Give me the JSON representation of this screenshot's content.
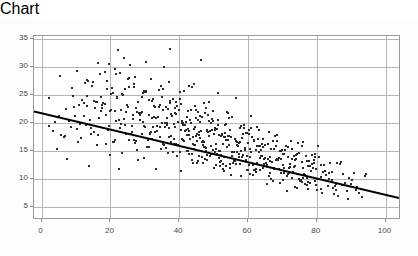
{
  "chart_data": {
    "type": "scatter",
    "title": "",
    "xlabel": "",
    "ylabel": "",
    "xlim": [
      -2.2,
      104.5
    ],
    "ylim": [
      2.6,
      35.6
    ],
    "grid": true,
    "legend": null,
    "xticks": [
      0,
      20,
      40,
      60,
      80,
      100
    ],
    "xtick_labels": [
      "0",
      "20",
      "40",
      "60",
      "80",
      "100"
    ],
    "yticks": [
      5,
      10,
      15,
      20,
      25,
      30,
      35
    ],
    "ytick_labels": [
      "5",
      "10",
      "15",
      "20",
      "25",
      "30",
      "35"
    ],
    "marker": {
      "shape": "square",
      "size_px": 2,
      "color": "#2b2b2b"
    },
    "trendline": {
      "type": "linear",
      "color": "#000000",
      "width_px": 2,
      "x_start": -2.2,
      "y_start": 21.9,
      "x_end": 104.5,
      "y_end": 6.2,
      "slope": -0.147,
      "intercept": 21.58
    },
    "n_points": 720,
    "series": [
      {
        "name": "observations",
        "x": [
          16.4,
          21.9,
          12.3,
          46.0,
          36.9,
          21.1,
          25.4,
          14.8,
          18.7,
          23.2,
          30.1,
          19.5,
          27.0,
          33.8,
          41.2,
          17.6,
          22.5,
          28.9,
          35.4,
          44.1,
          12.9,
          15.3,
          20.2,
          24.8,
          31.6,
          38.0,
          42.7,
          47.3,
          51.0,
          55.2,
          8.2,
          10.5,
          13.7,
          16.9,
          19.1,
          23.9,
          26.3,
          29.8,
          32.4,
          34.7,
          37.1,
          39.6,
          43.3,
          45.8,
          48.5,
          50.9,
          53.6,
          56.1,
          58.4,
          60.7,
          5.4,
          7.8,
          11.2,
          14.1,
          17.3,
          20.8,
          22.7,
          25.9,
          28.1,
          30.6,
          33.2,
          35.9,
          38.7,
          40.4,
          42.1,
          44.6,
          46.9,
          49.2,
          52.0,
          54.3,
          57.0,
          59.5,
          62.2,
          64.8,
          67.1,
          69.4,
          71.8,
          74.3,
          76.9,
          79.2,
          2.9,
          6.1,
          9.4,
          12.6,
          15.8,
          18.2,
          21.4,
          24.1,
          27.3,
          29.0,
          31.8,
          34.1,
          36.5,
          38.9,
          41.0,
          43.5,
          45.2,
          47.8,
          50.1,
          52.6,
          55.0,
          57.4,
          59.9,
          62.5,
          65.0,
          67.6,
          70.1,
          72.5,
          75.0,
          77.4,
          4.2,
          7.1,
          10.3,
          13.4,
          16.2,
          19.7,
          22.3,
          25.1,
          27.8,
          30.4,
          32.9,
          35.3,
          37.8,
          40.2,
          42.8,
          45.0,
          47.5,
          49.8,
          52.3,
          54.7,
          57.2,
          59.6,
          62.0,
          64.4,
          66.9,
          69.2,
          71.4,
          73.8,
          76.2,
          78.6,
          3.5,
          6.7,
          9.9,
          12.1,
          15.0,
          18.5,
          21.0,
          23.6,
          26.8,
          29.4,
          31.1,
          33.6,
          36.0,
          38.4,
          40.9,
          43.1,
          45.6,
          48.0,
          50.5,
          53.0,
          55.5,
          58.0,
          60.4,
          62.8,
          65.3,
          67.8,
          70.3,
          72.8,
          75.3,
          77.8,
          11.5,
          14.4,
          17.0,
          19.9,
          22.1,
          24.5,
          26.0,
          28.6,
          31.3,
          33.0,
          35.7,
          37.4,
          39.2,
          41.6,
          43.9,
          46.2,
          48.7,
          51.2,
          53.4,
          55.8,
          58.2,
          60.6,
          63.1,
          65.6,
          68.0,
          70.6,
          73.0,
          75.6,
          78.0,
          80.4,
          20.5,
          23.0,
          25.6,
          27.1,
          29.6,
          32.1,
          34.5,
          36.8,
          39.0,
          41.4,
          43.7,
          46.5,
          49.0,
          51.5,
          54.0,
          56.5,
          59.0,
          61.4,
          63.8,
          66.2,
          68.8,
          71.2,
          73.5,
          76.0,
          78.4,
          80.9,
          83.2,
          85.6,
          88.0,
          90.4,
          24.0,
          26.5,
          28.3,
          30.9,
          33.4,
          35.1,
          37.6,
          40.0,
          42.4,
          44.8,
          47.1,
          49.5,
          52.1,
          54.5,
          57.1,
          59.4,
          61.8,
          64.2,
          66.6,
          69.0,
          71.6,
          74.0,
          76.4,
          79.0,
          81.5,
          84.0,
          86.5,
          89.0,
          91.5,
          94.0,
          30.2,
          32.6,
          34.9,
          37.2,
          39.8,
          42.2,
          44.4,
          46.8,
          48.9,
          51.4,
          53.8,
          56.2,
          58.6,
          61.0,
          63.4,
          65.8,
          68.4,
          70.8,
          73.2,
          75.8,
          13.0,
          15.6,
          18.0,
          20.4,
          22.8,
          25.2,
          27.6,
          30.0,
          32.3,
          34.6,
          36.6,
          38.6,
          40.6,
          42.6,
          44.2,
          46.4,
          48.2,
          50.2,
          52.8,
          54.9,
          57.6,
          60.0,
          62.4,
          64.6,
          67.4,
          69.8,
          72.0,
          74.6,
          77.0,
          79.6,
          8.8,
          11.9,
          14.6,
          17.4,
          19.3,
          21.7,
          24.3,
          26.7,
          29.2,
          31.5,
          33.9,
          36.2,
          38.2,
          40.8,
          42.3,
          44.9,
          47.0,
          49.4,
          51.8,
          53.2,
          56.0,
          58.8,
          61.2,
          63.6,
          66.0,
          68.6,
          71.0,
          73.4,
          75.4,
          77.2,
          1.8,
          5.0,
          8.5,
          12.8,
          16.6,
          20.0,
          23.4,
          26.2,
          28.8,
          31.0,
          33.5,
          35.5,
          37.0,
          39.4,
          41.8,
          43.4,
          45.4,
          47.2,
          49.6,
          51.6,
          54.2,
          56.8,
          58.5,
          60.2,
          62.6,
          64.0,
          66.4,
          68.2,
          70.4,
          72.2,
          74.8,
          76.6,
          79.4,
          81.0,
          83.6,
          85.0,
          87.4,
          89.6,
          92.0,
          93.6,
          19.2,
          21.2,
          23.8,
          26.6,
          29.1,
          31.7,
          34.3,
          36.4,
          38.1,
          40.1,
          42.0,
          44.0,
          45.9,
          47.6,
          49.1,
          51.1,
          53.1,
          55.1,
          57.8,
          59.2,
          61.6,
          63.0,
          65.4,
          67.0,
          69.6,
          71.6,
          73.6,
          75.2,
          77.6,
          79.8,
          27.4,
          29.9,
          32.0,
          34.0,
          36.1,
          38.3,
          40.3,
          42.5,
          44.7,
          46.6,
          48.4,
          50.4,
          52.4,
          54.4,
          56.4,
          58.1,
          60.1,
          62.1,
          64.1,
          66.1,
          68.1,
          70.0,
          72.4,
          74.4,
          76.8,
          78.8,
          80.2,
          82.0,
          84.4,
          86.0,
          10.0,
          13.2,
          16.0,
          18.8,
          21.6,
          24.7,
          27.2,
          29.5,
          31.9,
          34.2,
          36.3,
          38.5,
          40.5,
          42.9,
          44.3,
          46.1,
          47.9,
          50.0,
          51.9,
          53.9,
          55.6,
          57.5,
          59.8,
          61.9,
          63.9,
          65.9,
          67.9,
          69.9,
          71.9,
          73.9,
          45.5,
          47.4,
          49.3,
          51.3,
          52.9,
          54.6,
          56.6,
          58.3,
          60.3,
          62.3,
          43.0,
          44.5,
          46.3,
          48.3,
          50.3,
          52.2,
          53.5,
          55.4,
          57.3,
          59.3,
          39.9,
          41.3,
          43.8,
          45.7,
          47.7,
          49.7,
          51.7,
          53.3,
          55.9,
          57.7,
          36.7,
          38.8,
          40.7,
          42.7,
          44.1,
          45.1,
          46.7,
          48.6,
          50.6,
          52.5,
          59.1,
          60.5,
          61.5,
          63.2,
          64.5,
          66.3,
          67.2,
          69.1,
          70.2,
          71.1,
          72.6,
          74.1,
          75.5,
          77.1,
          78.2,
          79.1,
          80.8,
          82.4,
          84.8,
          87.0,
          2.0,
          4.8,
          6.4,
          9.2,
          11.0,
          14.2,
          15.9,
          18.4,
          20.9,
          22.4,
          80.0,
          81.8,
          83.0,
          84.2,
          85.4,
          86.8,
          88.4,
          90.0,
          91.2,
          93.0,
          25.0,
          28.4,
          30.8,
          32.8,
          35.0,
          37.3,
          39.5,
          41.9,
          43.6,
          45.3,
          47.9,
          50.8,
          52.7,
          54.1,
          56.3,
          58.9,
          61.1,
          63.3,
          65.2,
          67.3,
          69.3,
          71.3,
          73.3,
          75.7,
          77.3,
          79.3,
          81.3,
          83.4,
          85.2,
          88.8
        ],
        "y": [
          21.0,
          33.2,
          27.3,
          31.5,
          33.4,
          29.8,
          30.6,
          24.2,
          27.8,
          25.3,
          31.2,
          22.4,
          28.5,
          26.1,
          25.9,
          23.7,
          29.2,
          24.9,
          30.3,
          27.1,
          25.1,
          22.8,
          26.4,
          23.1,
          28.0,
          24.4,
          26.8,
          22.0,
          25.5,
          21.3,
          19.4,
          23.5,
          20.8,
          24.8,
          18.9,
          26.2,
          21.7,
          25.7,
          23.3,
          20.1,
          24.1,
          22.6,
          26.6,
          20.4,
          23.9,
          19.8,
          22.2,
          24.6,
          18.3,
          21.5,
          18.1,
          20.6,
          17.5,
          19.2,
          22.9,
          16.8,
          20.0,
          18.6,
          21.9,
          17.2,
          19.6,
          23.0,
          16.4,
          20.2,
          18.0,
          22.5,
          15.9,
          19.0,
          17.8,
          21.1,
          14.6,
          18.4,
          16.0,
          13.9,
          17.0,
          15.2,
          12.8,
          16.6,
          10.4,
          14.1,
          18.8,
          17.6,
          21.4,
          19.9,
          16.2,
          23.6,
          20.5,
          18.2,
          15.4,
          22.1,
          17.3,
          19.5,
          14.8,
          21.8,
          16.9,
          13.5,
          20.7,
          18.7,
          15.0,
          17.7,
          14.2,
          19.3,
          12.6,
          16.1,
          13.0,
          17.9,
          11.2,
          15.6,
          10.0,
          13.3,
          15.5,
          13.8,
          16.7,
          12.4,
          18.1,
          14.4,
          11.9,
          17.1,
          13.6,
          15.8,
          12.0,
          16.3,
          14.9,
          11.5,
          17.4,
          13.1,
          15.1,
          12.2,
          16.5,
          10.8,
          14.0,
          11.7,
          15.3,
          12.9,
          9.8,
          13.7,
          11.0,
          14.5,
          9.2,
          12.1,
          20.3,
          22.7,
          19.1,
          23.8,
          18.5,
          21.6,
          17.1,
          20.9,
          16.6,
          19.7,
          18.3,
          21.2,
          15.7,
          19.4,
          17.2,
          20.1,
          14.3,
          18.6,
          16.5,
          19.8,
          13.4,
          17.5,
          15.5,
          18.9,
          12.7,
          16.0,
          14.7,
          11.4,
          13.2,
          9.5,
          24.3,
          26.9,
          22.3,
          25.4,
          20.7,
          23.4,
          19.6,
          22.0,
          18.4,
          21.0,
          20.2,
          17.9,
          23.2,
          19.0,
          16.3,
          21.3,
          18.8,
          15.2,
          20.0,
          17.4,
          14.5,
          19.2,
          16.1,
          13.7,
          18.0,
          15.3,
          12.3,
          16.8,
          11.6,
          14.0,
          16.7,
          14.8,
          18.2,
          16.9,
          13.9,
          19.4,
          15.6,
          17.6,
          14.2,
          18.8,
          13.1,
          16.2,
          14.6,
          12.5,
          17.8,
          15.0,
          13.3,
          11.8,
          16.4,
          14.1,
          12.0,
          15.9,
          13.5,
          11.1,
          14.4,
          12.7,
          10.2,
          13.0,
          9.4,
          11.3,
          19.9,
          17.2,
          20.8,
          15.8,
          18.7,
          16.4,
          21.5,
          14.9,
          19.1,
          17.0,
          13.8,
          15.4,
          18.3,
          12.9,
          16.6,
          14.3,
          11.7,
          17.3,
          13.2,
          15.1,
          12.2,
          14.7,
          10.9,
          13.6,
          11.4,
          9.9,
          12.8,
          10.3,
          8.7,
          11.0,
          25.8,
          23.1,
          26.3,
          21.8,
          24.5,
          22.3,
          19.5,
          23.7,
          20.1,
          18.0,
          21.9,
          16.9,
          19.8,
          17.7,
          15.4,
          18.5,
          13.6,
          16.1,
          14.2,
          12.1,
          27.9,
          24.0,
          29.3,
          25.6,
          22.6,
          28.2,
          23.9,
          26.0,
          21.2,
          24.9,
          19.3,
          22.8,
          20.6,
          18.1,
          23.3,
          16.7,
          21.7,
          19.0,
          14.1,
          17.6,
          15.2,
          18.9,
          13.0,
          16.2,
          11.9,
          14.6,
          12.3,
          10.1,
          13.4,
          9.0,
          25.0,
          21.4,
          27.5,
          23.5,
          19.7,
          24.7,
          22.2,
          26.7,
          20.3,
          18.6,
          23.0,
          21.1,
          17.3,
          19.9,
          15.1,
          18.3,
          16.8,
          20.5,
          14.4,
          17.1,
          13.3,
          15.7,
          12.6,
          14.2,
          11.2,
          13.9,
          10.6,
          12.4,
          9.6,
          8.4,
          24.6,
          28.6,
          26.5,
          23.3,
          29.0,
          22.5,
          25.2,
          20.9,
          18.2,
          21.6,
          17.0,
          19.5,
          23.8,
          16.3,
          20.4,
          14.7,
          18.1,
          15.9,
          22.4,
          13.2,
          17.8,
          16.0,
          19.3,
          14.0,
          17.4,
          12.1,
          15.6,
          13.8,
          11.5,
          16.9,
          9.7,
          14.3,
          12.0,
          10.5,
          13.1,
          8.9,
          11.1,
          9.3,
          7.6,
          10.7,
          30.8,
          28.9,
          31.8,
          27.2,
          25.5,
          24.2,
          26.8,
          22.7,
          20.0,
          23.6,
          21.3,
          19.1,
          17.5,
          22.9,
          16.1,
          20.8,
          18.4,
          15.0,
          19.6,
          13.5,
          17.2,
          14.9,
          16.4,
          12.2,
          15.3,
          11.3,
          13.7,
          10.0,
          12.5,
          8.2,
          22.1,
          19.4,
          24.4,
          17.6,
          20.2,
          16.5,
          18.9,
          14.6,
          21.0,
          13.1,
          17.9,
          15.5,
          12.8,
          19.0,
          16.7,
          14.0,
          18.3,
          11.9,
          15.8,
          13.4,
          17.0,
          12.6,
          10.4,
          14.8,
          9.1,
          13.0,
          16.0,
          11.6,
          8.6,
          7.1,
          29.6,
          27.7,
          31.0,
          26.2,
          24.8,
          28.1,
          22.9,
          25.9,
          21.1,
          23.4,
          19.8,
          22.0,
          17.4,
          20.7,
          16.2,
          18.7,
          14.5,
          19.2,
          13.3,
          17.1,
          15.0,
          12.9,
          16.6,
          11.4,
          14.2,
          10.7,
          13.6,
          9.9,
          12.3,
          8.5,
          18.5,
          15.7,
          20.9,
          13.9,
          17.7,
          12.2,
          16.3,
          14.4,
          11.1,
          19.4,
          22.6,
          17.8,
          14.1,
          20.6,
          12.7,
          18.0,
          15.9,
          13.0,
          16.8,
          11.8,
          25.7,
          19.9,
          16.5,
          21.4,
          13.5,
          18.2,
          15.2,
          12.4,
          17.3,
          10.6,
          27.6,
          23.9,
          20.1,
          18.8,
          15.6,
          22.2,
          17.0,
          14.3,
          19.1,
          12.0,
          18.4,
          14.9,
          16.9,
          11.7,
          13.8,
          10.2,
          15.5,
          9.4,
          12.1,
          8.0,
          13.7,
          11.0,
          16.1,
          9.6,
          12.8,
          14.6,
          8.3,
          10.9,
          7.4,
          9.0,
          19.7,
          21.5,
          17.9,
          23.1,
          20.0,
          18.3,
          24.0,
          16.4,
          22.3,
          19.2,
          10.1,
          12.6,
          8.8,
          11.4,
          9.2,
          13.2,
          7.9,
          10.0,
          8.1,
          6.9,
          26.6,
          21.6,
          24.3,
          18.6,
          22.5,
          16.8,
          20.4,
          15.1,
          17.6,
          13.4,
          19.0,
          14.7,
          11.6,
          16.3,
          12.9,
          15.4,
          10.8,
          13.9,
          9.3,
          12.2,
          11.2,
          14.1,
          8.7,
          10.4,
          12.5,
          9.8,
          7.7,
          11.3,
          8.1,
          6.5
        ]
      }
    ]
  },
  "axis": {
    "x_tick_pixel_start": 48,
    "x_tick_pixel_step": 66.8,
    "y_tick_pixel_top": 19,
    "y_tick_pixel_step": 27.8
  }
}
